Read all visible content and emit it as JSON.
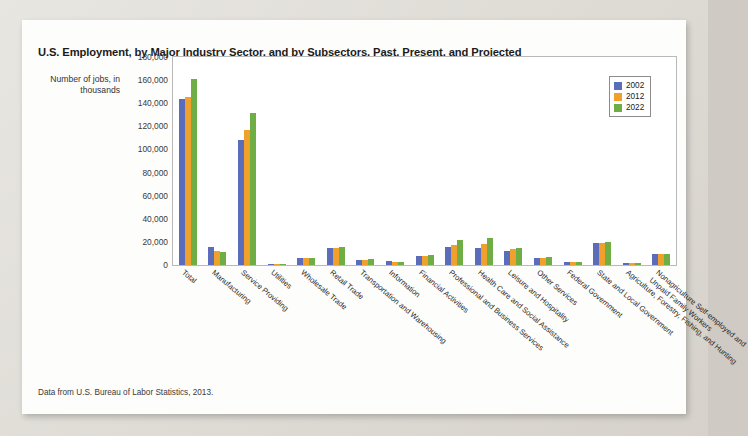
{
  "card": {
    "title": "U.S. Employment, by Major Industry Sector, and by Subsectors, Past, Present, and Projected",
    "source_note": "Data from U.S. Bureau of Labor Statistics, 2013.",
    "y_axis_caption": "Number of jobs, in thousands"
  },
  "legend": {
    "position": "top-right",
    "entries": [
      {
        "label": "2002",
        "color": "#5a6cba"
      },
      {
        "label": "2012",
        "color": "#f0a12b"
      },
      {
        "label": "2022",
        "color": "#6fae44"
      }
    ]
  },
  "chart_data": {
    "type": "bar",
    "title": "U.S. Employment, by Major Industry Sector, and by Subsectors, Past, Present, and Projected",
    "xlabel": "",
    "ylabel": "Number of jobs, in thousands",
    "ylim": [
      0,
      180000
    ],
    "yticks": [
      "0",
      "20,000",
      "40,000",
      "60,000",
      "80,000",
      "100,000",
      "120,000",
      "140,000",
      "160,000",
      "180,000"
    ],
    "ytick_values": [
      0,
      20000,
      40000,
      60000,
      80000,
      100000,
      120000,
      140000,
      160000,
      180000
    ],
    "grid": true,
    "categories": [
      "Total",
      "Manufacturing",
      "Service Providing",
      "Utilities",
      "Wholesale Trade",
      "Retail Trade",
      "Transportation and Warehousing",
      "Information",
      "Financial Activities",
      "Professional and Business Services",
      "Health Care and Social Assistance",
      "Leisure and Hospitality",
      "Other Services",
      "Federal Government",
      "State and Local Government",
      "Agriculture, Forestry, Fishing, and Hunting",
      "Nonagriculture Self-employed and Unpaid Family Workers"
    ],
    "series": [
      {
        "name": "2002",
        "color": "#5a6cba",
        "values": [
          144000,
          15300,
          107800,
          600,
          5700,
          15000,
          4200,
          3400,
          7800,
          16000,
          14500,
          11900,
          6200,
          2800,
          18900,
          2100,
          9300
        ]
      },
      {
        "name": "2012",
        "color": "#f0a12b",
        "values": [
          145400,
          11900,
          116800,
          550,
          5700,
          14900,
          4400,
          2700,
          7800,
          17600,
          18100,
          13700,
          6100,
          2800,
          19200,
          2100,
          9400
        ]
      },
      {
        "name": "2022",
        "color": "#6fae44",
        "values": [
          160900,
          11300,
          131600,
          500,
          6000,
          16000,
          4900,
          2600,
          8300,
          21300,
          23500,
          14800,
          6600,
          2400,
          19700,
          1900,
          9800
        ]
      }
    ]
  }
}
